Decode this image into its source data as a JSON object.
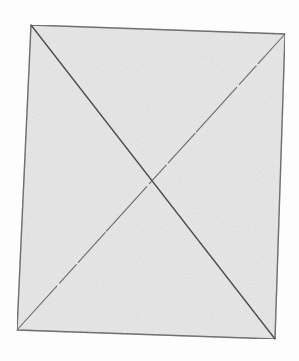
{
  "image": {
    "width": 299,
    "height": 361,
    "background_color": "#fdfdfd"
  },
  "sheet": {
    "fill_color": "#ececec",
    "edge_color": "#5a5a5a",
    "corners": {
      "top_left": [
        31,
        25
      ],
      "top_right": [
        285,
        34
      ],
      "bottom_right": [
        275,
        339
      ],
      "bottom_left": [
        17,
        330
      ]
    }
  },
  "diagonals": [
    {
      "from": "top_left",
      "to": "bottom_right",
      "color": "#4a4a4a"
    },
    {
      "from": "top_right",
      "to": "bottom_left",
      "color": "#6a6a6a"
    }
  ],
  "intersection": [
    152,
    188
  ]
}
